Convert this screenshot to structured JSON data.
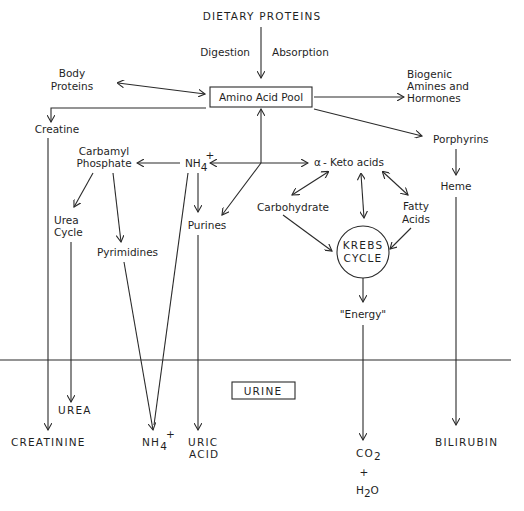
{
  "diagram": {
    "title": "DIETARY PROTEINS",
    "edge_labels": {
      "digestion": "Digestion",
      "absorption": "Absorption"
    },
    "nodes": {
      "amino_acid_pool": "Amino Acid Pool",
      "body_proteins_1": "Body",
      "body_proteins_2": "Proteins",
      "biogenic_1": "Biogenic",
      "biogenic_2": "Amines and",
      "biogenic_3": "Hormones",
      "creatine": "Creatine",
      "porphyrins": "Porphyrins",
      "heme": "Heme",
      "carbamyl_1": "Carbamyl",
      "carbamyl_2": "Phosphate",
      "nh4": "NH",
      "nh4_sub": "4",
      "nh4_sup": "+",
      "alpha": "α",
      "keto_acids": "- Keto acids",
      "carbohydrate": "Carbohydrate",
      "fatty_1": "Fatty",
      "fatty_2": "Acids",
      "urea_cycle_1": "Urea",
      "urea_cycle_2": "Cycle",
      "pyrimidines": "Pyrimidines",
      "purines": "Purines",
      "krebs_1": "KREBS",
      "krebs_2": "CYCLE",
      "energy": "\"Energy\""
    },
    "urine_box": "URINE",
    "products": {
      "creatinine": "CREATININE",
      "urea": "UREA",
      "nh4": "NH",
      "nh4_sub": "4",
      "nh4_sup": "+",
      "uric_1": "URIC",
      "uric_2": "ACID",
      "co2": "CO",
      "co2_sub": "2",
      "plus": "+",
      "h2o_h": "H",
      "h2o_sub": "2",
      "h2o_o": "O",
      "bilirubin": "BILIRUBIN"
    },
    "colors": {
      "line": "#2a2a2a",
      "text": "#1f1f1f",
      "background": "#ffffff"
    }
  }
}
